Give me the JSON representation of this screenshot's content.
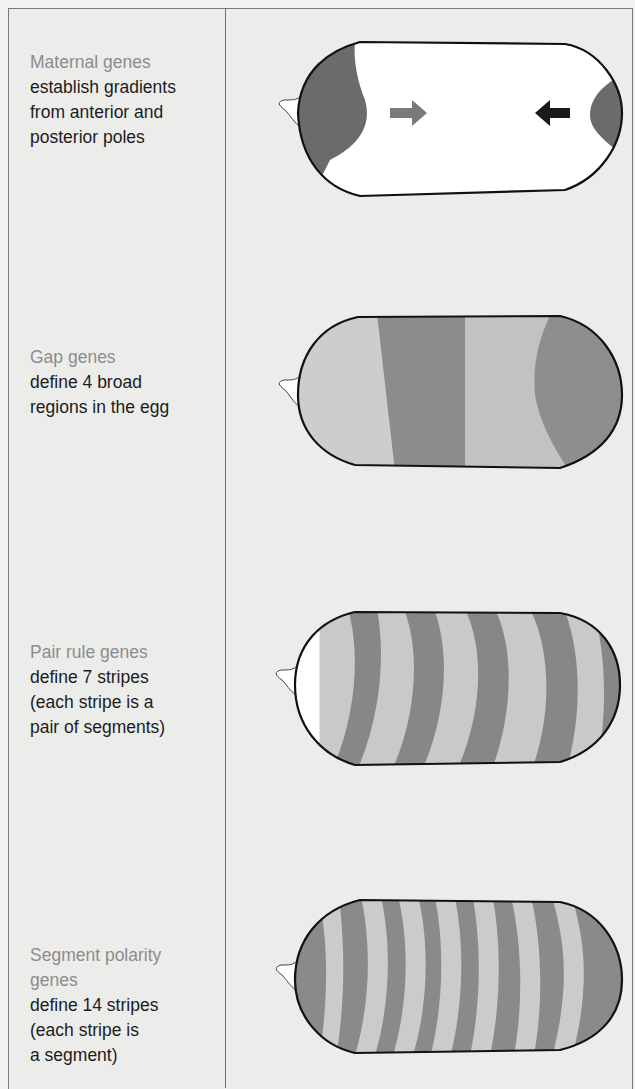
{
  "stages": [
    {
      "title": "Maternal genes",
      "description": "establish gradients\nfrom anterior and\nposterior poles"
    },
    {
      "title": "Gap genes",
      "description": "define 4 broad\nregions in the egg"
    },
    {
      "title": "Pair rule genes",
      "description": "define 7 stripes\n(each stripe is a\npair of segments)"
    },
    {
      "title": "Segment polarity\ngenes",
      "description": "define 14 stripes\n(each stripe is\na segment)"
    }
  ],
  "colors": {
    "dark": "#6b6b6b",
    "mid": "#8e8e8e",
    "light": "#c9c9c9",
    "white": "#ffffff",
    "outline": "#111111",
    "arrow_anterior": "#7a7a7a",
    "arrow_posterior": "#1a1a1a"
  }
}
